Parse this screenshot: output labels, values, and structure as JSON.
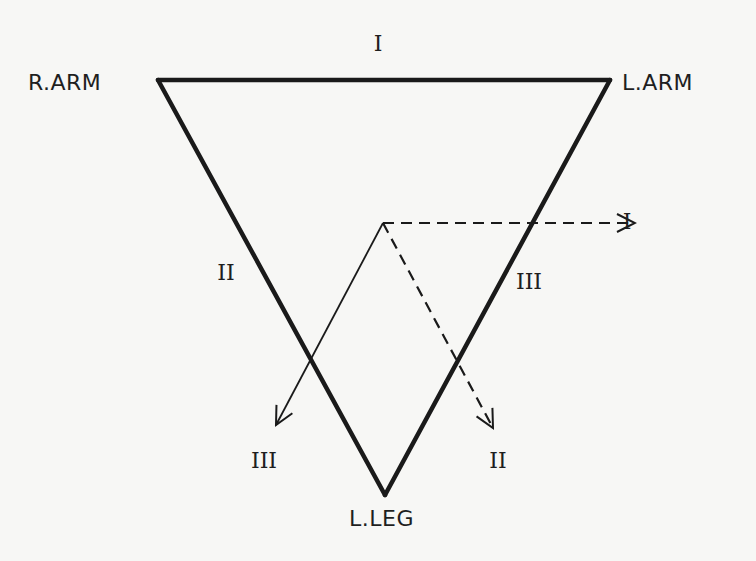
{
  "diagram": {
    "vertices": [
      {
        "id": "r_arm",
        "label": "R.ARM",
        "x": 158,
        "y": 80
      },
      {
        "id": "l_arm",
        "label": "L.ARM",
        "x": 610,
        "y": 80
      },
      {
        "id": "l_leg",
        "label": "L.LEG",
        "x": 385,
        "y": 495
      }
    ],
    "sides": [
      {
        "lead": "I",
        "label": "I",
        "from": "r_arm",
        "to": "l_arm",
        "label_x": 378,
        "label_y": 44
      },
      {
        "lead": "II",
        "label": "II",
        "from": "r_arm",
        "to": "l_leg",
        "label_x": 226,
        "label_y": 273
      },
      {
        "lead": "III",
        "label": "III",
        "from": "l_arm",
        "to": "l_leg",
        "label_x": 529,
        "label_y": 282
      }
    ],
    "vector_origin": {
      "x": 383,
      "y": 223
    },
    "vectors": [
      {
        "lead": "I",
        "label": "I",
        "style": "dashed",
        "to_x": 635,
        "to_y": 223,
        "label_x": 627,
        "label_y": 222
      },
      {
        "lead": "II",
        "label": "II",
        "style": "dashed",
        "to_x": 493,
        "to_y": 428,
        "label_x": 498,
        "label_y": 461
      },
      {
        "lead": "III",
        "label": "III",
        "style": "solid",
        "to_x": 276,
        "to_y": 425,
        "label_x": 264,
        "label_y": 461
      }
    ],
    "colors": {
      "background": "#f7f7f5",
      "ink": "#1a1a1a"
    }
  }
}
